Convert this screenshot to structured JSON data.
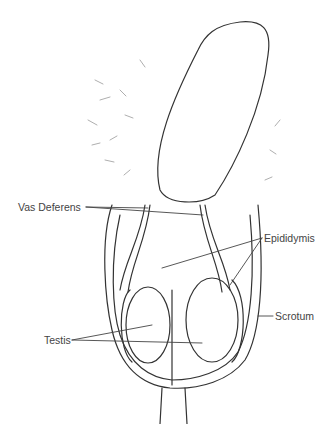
{
  "diagram": {
    "type": "anatomical line drawing",
    "labels": {
      "vas_deferens": "Vas Deferens",
      "epididymis": "Epididymis",
      "scrotum": "Scrotum",
      "testis": "Testis"
    },
    "colors": {
      "line": "#333333",
      "text": "#444444",
      "background": "#ffffff"
    }
  }
}
